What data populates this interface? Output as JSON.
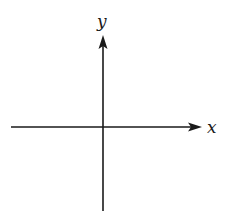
{
  "diagram": {
    "type": "cartesian-axes",
    "origin": {
      "x": 103,
      "y": 127
    },
    "x_axis": {
      "label": "x",
      "start": {
        "x": 11,
        "y": 127
      },
      "end": {
        "x": 202,
        "y": 127
      },
      "arrow": "end",
      "label_position": {
        "x": 207,
        "y": 133
      }
    },
    "y_axis": {
      "label": "y",
      "start": {
        "x": 103,
        "y": 211
      },
      "end": {
        "x": 103,
        "y": 35
      },
      "arrow": "end",
      "label_position": {
        "x": 97,
        "y": 27
      }
    },
    "colors": {
      "line": "#1a1a1a",
      "background": "#ffffff"
    }
  }
}
